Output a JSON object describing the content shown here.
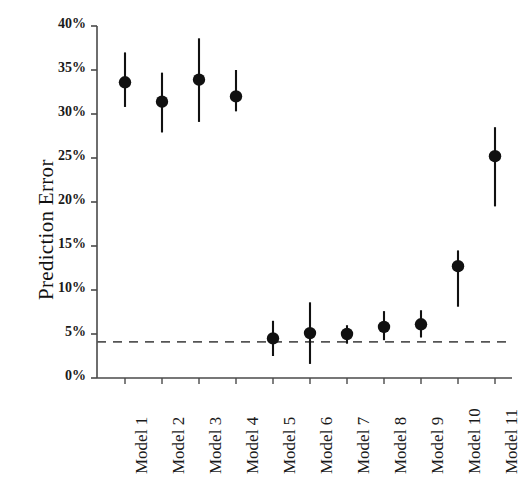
{
  "chart_data": {
    "type": "scatter",
    "title": "",
    "subtitle": "",
    "xlabel": "",
    "ylabel": "Prediction Error",
    "categories": [
      "Model 1",
      "Model 2",
      "Model 3",
      "Model 4",
      "Model 5",
      "Model 6",
      "Model 7",
      "Model 8",
      "Model 9",
      "Model 10",
      "Model 11"
    ],
    "values": [
      33.6,
      31.4,
      33.9,
      32.0,
      4.5,
      5.1,
      5.0,
      5.8,
      6.1,
      12.7,
      25.2
    ],
    "error_low": [
      30.8,
      27.9,
      29.1,
      30.3,
      2.5,
      1.6,
      3.9,
      4.3,
      4.6,
      8.1,
      19.5
    ],
    "error_high": [
      37.0,
      34.7,
      38.6,
      35.0,
      6.5,
      8.6,
      6.0,
      7.6,
      7.7,
      14.5,
      28.5
    ],
    "ylim": [
      0,
      40
    ],
    "ytick_values": [
      0,
      5,
      10,
      15,
      20,
      25,
      30,
      35,
      40
    ],
    "ytick_labels": [
      "0%",
      "5%",
      "10%",
      "15%",
      "20%",
      "25%",
      "30%",
      "35%",
      "40%"
    ],
    "reference_line": {
      "value": 4.1,
      "style": "dashed",
      "label": ""
    },
    "grid": false,
    "legend": null,
    "marker": "circle",
    "series_color": "#111111",
    "axis_color": "#4a4a4a",
    "reference_line_color": "#555555",
    "background_color": "#ffffff"
  }
}
